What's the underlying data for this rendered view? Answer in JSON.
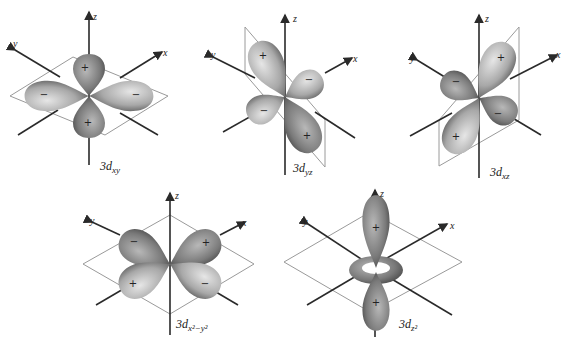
{
  "colors": {
    "lobe_dark": "#5e5e5e",
    "lobe_light": "#dedede",
    "plane": "#9a9a9a",
    "axis": "#2a2a2a"
  },
  "axis_labels": {
    "x": "x",
    "y": "y",
    "z": "z"
  },
  "orbitals": [
    {
      "name": "3d_xy",
      "prefix": "3d",
      "subscript": "xy",
      "lobes": [
        {
          "position": "top",
          "sign": "+"
        },
        {
          "position": "bottom",
          "sign": "+"
        },
        {
          "position": "left",
          "sign": "−"
        },
        {
          "position": "right",
          "sign": "−"
        }
      ]
    },
    {
      "name": "3d_yz",
      "prefix": "3d",
      "subscript": "yz",
      "lobes": [
        {
          "position": "upper-left",
          "sign": "+"
        },
        {
          "position": "right",
          "sign": "−"
        },
        {
          "position": "left",
          "sign": "−"
        },
        {
          "position": "lower-right",
          "sign": "+"
        }
      ]
    },
    {
      "name": "3d_xz",
      "prefix": "3d",
      "subscript": "xz",
      "lobes": [
        {
          "position": "upper-right",
          "sign": "+"
        },
        {
          "position": "left",
          "sign": "−"
        },
        {
          "position": "right",
          "sign": "−"
        },
        {
          "position": "lower-left",
          "sign": "+"
        }
      ]
    },
    {
      "name": "3d_x2-y2",
      "prefix": "3d",
      "subscript": "x²−y²",
      "lobes": [
        {
          "position": "upper-left",
          "sign": "−"
        },
        {
          "position": "upper-right",
          "sign": "+"
        },
        {
          "position": "lower-left",
          "sign": "+"
        },
        {
          "position": "lower-right",
          "sign": "−"
        }
      ]
    },
    {
      "name": "3d_z2",
      "prefix": "3d",
      "subscript": "z²",
      "lobes": [
        {
          "position": "top",
          "sign": "+"
        },
        {
          "position": "bottom",
          "sign": "+"
        },
        {
          "position": "torus",
          "sign": ""
        }
      ]
    }
  ]
}
